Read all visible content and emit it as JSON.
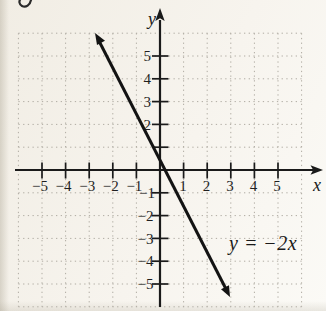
{
  "figure": {
    "axis_labels": {
      "x": "x",
      "y": "y"
    },
    "equation_label": "y = −2x",
    "x_tick_labels": [
      "−5",
      "−4",
      "−3",
      "−2",
      "−1",
      "1",
      "2",
      "3",
      "4",
      "5"
    ],
    "y_tick_labels": [
      "5",
      "4",
      "3",
      "2",
      "−1",
      "−2",
      "−3",
      "−4",
      "−5"
    ]
  },
  "chart_data": {
    "type": "line",
    "title": "",
    "xlabel": "x",
    "ylabel": "y",
    "xlim": [
      -6,
      6
    ],
    "ylim": [
      -6,
      6
    ],
    "x_ticks": [
      -5,
      -4,
      -3,
      -2,
      -1,
      1,
      2,
      3,
      4,
      5
    ],
    "y_ticks": [
      -5,
      -4,
      -3,
      -2,
      -1,
      1,
      2,
      3,
      4,
      5
    ],
    "grid": "dotted",
    "series": [
      {
        "name": "y = −2x",
        "equation": "y = −2x",
        "slope": -2,
        "y_intercept": 0,
        "points": [
          {
            "x": -3,
            "y": 6
          },
          {
            "x": -2,
            "y": 4
          },
          {
            "x": -1,
            "y": 2
          },
          {
            "x": 0,
            "y": 0
          },
          {
            "x": 1,
            "y": -2
          },
          {
            "x": 2,
            "y": -4
          },
          {
            "x": 3,
            "y": -6
          }
        ],
        "arrows_both_ends": true
      }
    ],
    "annotations": [
      {
        "text": "y = −2x",
        "x": 3,
        "y": -3.2
      }
    ]
  },
  "colors": {
    "background": "#f6f3ec",
    "grid": "#b0aca3",
    "axis": "#1a1a1a",
    "line": "#131313",
    "text": "#1f1f1f"
  }
}
